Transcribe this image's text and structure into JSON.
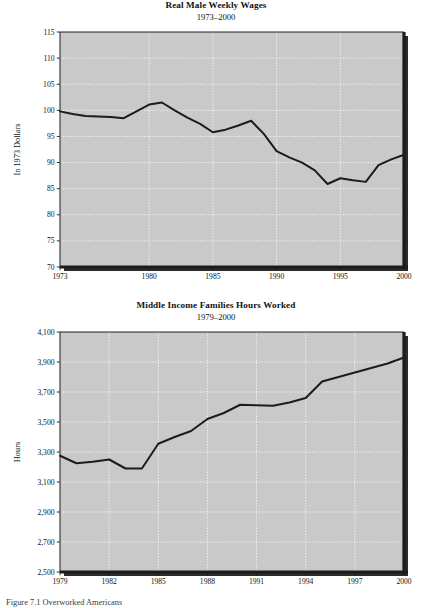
{
  "page": {
    "caption": "Figure 7.1  Overworked Americans"
  },
  "chart_data": [
    {
      "type": "line",
      "title": "Real Male Weekly Wages",
      "subtitle": "1973–2000",
      "xlabel": "",
      "ylabel": "In 1973 Dollars",
      "ylim": [
        70,
        115
      ],
      "xlim": [
        1973,
        2000
      ],
      "yticks": [
        "70",
        "75",
        "80",
        "85",
        "90",
        "95",
        "100",
        "105",
        "110",
        "115"
      ],
      "ytick_values": [
        70,
        75,
        80,
        85,
        90,
        95,
        100,
        105,
        110,
        115
      ],
      "xticks": [
        "1973",
        "1980",
        "1985",
        "1990",
        "1995",
        "2000"
      ],
      "xtick_values": [
        1973,
        1980,
        1985,
        1990,
        1995,
        2000
      ],
      "grid": true,
      "legend": null,
      "plot_background": "#c9c9c9",
      "line_color": "#1c1c1c",
      "x": [
        1973,
        1974,
        1975,
        1976,
        1977,
        1978,
        1979,
        1980,
        1981,
        1982,
        1983,
        1984,
        1985,
        1986,
        1987,
        1988,
        1989,
        1990,
        1991,
        1992,
        1993,
        1994,
        1995,
        1996,
        1997,
        1998,
        1999,
        2000
      ],
      "values": [
        99.8,
        99.3,
        98.9,
        98.8,
        98.7,
        98.5,
        99.8,
        101.1,
        101.5,
        100.0,
        98.6,
        97.4,
        95.8,
        96.3,
        97.1,
        98.0,
        95.5,
        92.2,
        91.0,
        90.0,
        88.5,
        85.9,
        87.0,
        86.6,
        86.3,
        89.5,
        90.6,
        91.5
      ]
    },
    {
      "type": "line",
      "title": "Middle Income Families Hours Worked",
      "subtitle": "1979–2000",
      "xlabel": "",
      "ylabel": "Hours",
      "ylim": [
        2500,
        4100
      ],
      "xlim": [
        1979,
        2000
      ],
      "yticks": [
        "2,500",
        "2,700",
        "2,900",
        "3,100",
        "3,300",
        "3,500",
        "3,700",
        "3,900",
        "4,100"
      ],
      "ytick_values": [
        2500,
        2700,
        2900,
        3100,
        3300,
        3500,
        3700,
        3900,
        4100
      ],
      "xticks": [
        "1979",
        "1982",
        "1985",
        "1988",
        "1991",
        "1994",
        "1997",
        "2000"
      ],
      "xtick_values": [
        1979,
        1982,
        1985,
        1988,
        1991,
        1994,
        1997,
        2000
      ],
      "grid": true,
      "legend": null,
      "plot_background": "#c9c9c9",
      "line_color": "#1c1c1c",
      "x": [
        1979,
        1980,
        1981,
        1982,
        1983,
        1984,
        1985,
        1986,
        1987,
        1988,
        1989,
        1990,
        1991,
        1992,
        1993,
        1994,
        1995,
        1996,
        1997,
        1998,
        1999,
        2000
      ],
      "values": [
        3275,
        3225,
        3235,
        3250,
        3190,
        3190,
        3355,
        3400,
        3440,
        3520,
        3560,
        3615,
        3612,
        3608,
        3630,
        3660,
        3770,
        3800,
        3830,
        3860,
        3890,
        3930
      ]
    }
  ]
}
